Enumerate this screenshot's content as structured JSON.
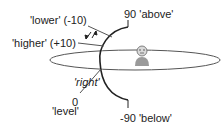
{
  "diagram": {
    "labels": {
      "lower": "'lower' (-10)",
      "higher": "'higher' (+10)",
      "above": "90 'above'",
      "below": "-90 'below'",
      "right": "'right'",
      "level_value": "0",
      "level": "'level'"
    },
    "colors": {
      "stroke": "#222222",
      "head": "#d9d9d9",
      "body": "#9a9a9a",
      "background": "#ffffff"
    }
  }
}
